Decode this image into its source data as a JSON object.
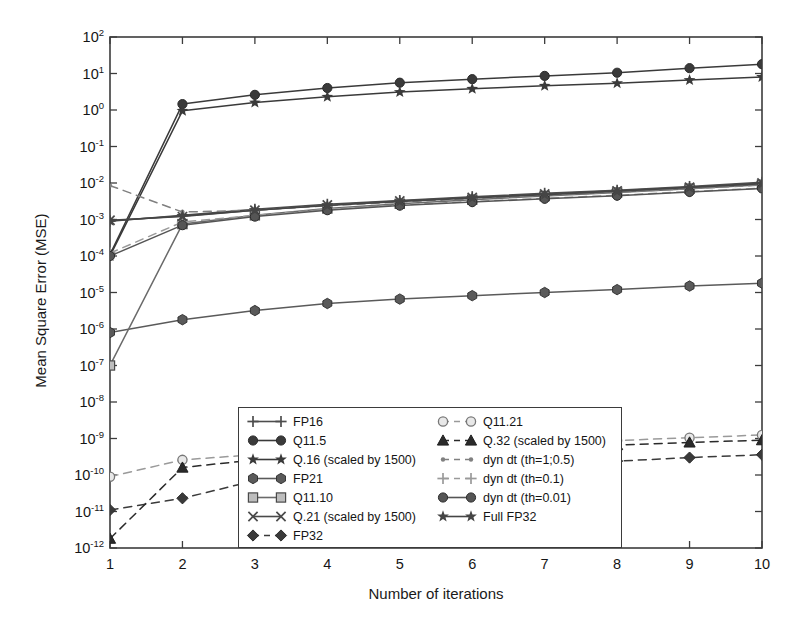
{
  "chart_data": {
    "type": "line",
    "title": "",
    "xlabel": "Number of iterations",
    "ylabel": "Mean Square Error (MSE)",
    "yscale": "log",
    "xlim": [
      1,
      10
    ],
    "ylim": [
      1e-12,
      100
    ],
    "grid": false,
    "legend_position": "lower center",
    "x": [
      1,
      2,
      3,
      4,
      5,
      6,
      7,
      8,
      9,
      10
    ],
    "xticks": [
      "1",
      "2",
      "3",
      "4",
      "5",
      "6",
      "7",
      "8",
      "9",
      "10"
    ],
    "yticks": [
      {
        "label": "10",
        "exp": "2",
        "value": 100
      },
      {
        "label": "10",
        "exp": "1",
        "value": 10
      },
      {
        "label": "10",
        "exp": "0",
        "value": 1
      },
      {
        "label": "10",
        "exp": "-1",
        "value": 0.1
      },
      {
        "label": "10",
        "exp": "-2",
        "value": 0.01
      },
      {
        "label": "10",
        "exp": "-3",
        "value": 0.001
      },
      {
        "label": "10",
        "exp": "-4",
        "value": 0.0001
      },
      {
        "label": "10",
        "exp": "-5",
        "value": 1e-05
      },
      {
        "label": "10",
        "exp": "-6",
        "value": 1e-06
      },
      {
        "label": "10",
        "exp": "-7",
        "value": 1e-07
      },
      {
        "label": "10",
        "exp": "-8",
        "value": 1e-08
      },
      {
        "label": "10",
        "exp": "-9",
        "value": 1e-09
      },
      {
        "label": "10",
        "exp": "-10",
        "value": 1e-10
      },
      {
        "label": "10",
        "exp": "-11",
        "value": 1e-11
      },
      {
        "label": "10",
        "exp": "-12",
        "value": 1e-12
      }
    ],
    "series": [
      {
        "name": "FP16",
        "marker": "plus",
        "linestyle": "solid",
        "color": "#4d4d4d",
        "values": [
          0.0009,
          0.0013,
          0.0019,
          0.0026,
          0.0033,
          0.0042,
          0.0052,
          0.0063,
          0.008,
          0.0105
        ]
      },
      {
        "name": "Q11.5",
        "marker": "circle",
        "linestyle": "solid",
        "color": "#3a3a3a",
        "values": [
          0.00011,
          1.45,
          2.6,
          4.0,
          5.6,
          7.0,
          8.6,
          10.5,
          14.0,
          18.0
        ]
      },
      {
        "name": "Q.16 (scaled by 1500)",
        "marker": "star",
        "linestyle": "solid",
        "color": "#3a3a3a",
        "values": [
          0.0001,
          0.95,
          1.6,
          2.3,
          3.1,
          3.8,
          4.6,
          5.4,
          6.6,
          8.0
        ]
      },
      {
        "name": "FP21",
        "marker": "hexagon",
        "linestyle": "solid",
        "color": "#5a5a5a",
        "values": [
          8e-07,
          1.8e-06,
          3.2e-06,
          5e-06,
          6.6e-06,
          8.2e-06,
          1e-05,
          1.2e-05,
          1.5e-05,
          1.8e-05
        ]
      },
      {
        "name": "Q11.10",
        "marker": "square",
        "linestyle": "solid",
        "color": "#6a6a6a",
        "values": [
          1e-07,
          0.00075,
          0.0013,
          0.002,
          0.0027,
          0.0035,
          0.0044,
          0.0055,
          0.007,
          0.009
        ]
      },
      {
        "name": "Q.21 (scaled by 1500)",
        "marker": "x",
        "linestyle": "solid",
        "color": "#4a4a4a",
        "values": [
          0.00095,
          0.0012,
          0.0018,
          0.0025,
          0.0032,
          0.004,
          0.005,
          0.0061,
          0.0077,
          0.01
        ]
      },
      {
        "name": "FP32",
        "marker": "diamond",
        "linestyle": "dashed",
        "color": "#3a3a3a",
        "values": [
          1.1e-11,
          2.3e-11,
          7e-11,
          1.1e-10,
          1.4e-10,
          1.7e-10,
          2e-10,
          2.4e-10,
          3e-10,
          3.6e-10
        ]
      },
      {
        "name": "Q11.21",
        "marker": "circle-open",
        "linestyle": "dashed",
        "color": "#9a9a9a",
        "values": [
          9e-11,
          2.6e-10,
          3.6e-10,
          4.6e-10,
          5.6e-10,
          6.6e-10,
          7.6e-10,
          8.8e-10,
          1.05e-09,
          1.25e-09
        ]
      },
      {
        "name": "Q.32 (scaled by 1500)",
        "marker": "triangle",
        "linestyle": "dashed",
        "color": "#2a2a2a",
        "values": [
          1.8e-12,
          1.6e-10,
          2.6e-10,
          3.4e-10,
          4.2e-10,
          5e-10,
          5.8e-10,
          6.6e-10,
          7.8e-10,
          9e-10
        ]
      },
      {
        "name": "dyn dt (th=1;0.5)",
        "marker": "dot",
        "linestyle": "dashed",
        "color": "#808080",
        "values": [
          0.0085,
          0.0016,
          0.0018,
          0.0024,
          0.003,
          0.0037,
          0.0046,
          0.0056,
          0.007,
          0.0088
        ]
      },
      {
        "name": "dyn dt (th=0.1)",
        "marker": "plus",
        "linestyle": "dashed",
        "color": "#9a9a9a",
        "values": [
          0.00012,
          0.00085,
          0.0013,
          0.0019,
          0.0025,
          0.0031,
          0.0038,
          0.0046,
          0.0058,
          0.0072
        ]
      },
      {
        "name": "dyn dt (th=0.01)",
        "marker": "circle",
        "linestyle": "solid",
        "color": "#555555",
        "values": [
          0.0001,
          0.0007,
          0.0012,
          0.0018,
          0.0024,
          0.003,
          0.0037,
          0.0045,
          0.0057,
          0.0071
        ]
      },
      {
        "name": "Full FP32",
        "marker": "star",
        "linestyle": "solid",
        "color": "#454545",
        "values": [
          0.00092,
          0.00125,
          0.0018,
          0.0024,
          0.0031,
          0.0039,
          0.0048,
          0.0059,
          0.0075,
          0.0096
        ]
      }
    ],
    "legend_columns": [
      [
        "FP16",
        "Q11.5",
        "Q.16 (scaled by 1500)",
        "FP21",
        "Q11.10",
        "Q.21 (scaled by 1500)",
        "FP32"
      ],
      [
        "Q11.21",
        "Q.32 (scaled by 1500)",
        "dyn dt (th=1;0.5)",
        "dyn dt (th=0.1)",
        "dyn dt (th=0.01)",
        "Full FP32"
      ]
    ]
  }
}
